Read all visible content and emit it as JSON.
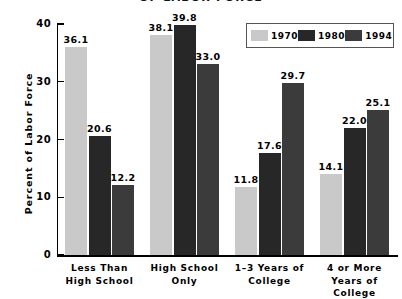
{
  "chart_data": {
    "type": "bar",
    "title": "OF LABOR FORCE",
    "xlabel": "",
    "ylabel": "Percent of Labor Force",
    "ylim": [
      0,
      40
    ],
    "yticks": [
      "0",
      "10",
      "20",
      "30",
      "40"
    ],
    "grid": false,
    "legend_position": "top-right",
    "categories": [
      "Less Than High School",
      "High School Only",
      "1–3 Years of College",
      "4 or More Years of College"
    ],
    "category_lines": [
      [
        "Less Than",
        "High School"
      ],
      [
        "High School",
        "Only"
      ],
      [
        "1–3 Years of",
        "College"
      ],
      [
        "4 or More",
        "Years of",
        "College"
      ]
    ],
    "series": [
      {
        "name": "1970",
        "color": "#c9c9c9",
        "values": [
          36.1,
          38.1,
          11.8,
          14.1
        ]
      },
      {
        "name": "1980",
        "color": "#272727",
        "values": [
          20.6,
          39.8,
          17.6,
          22.0
        ]
      },
      {
        "name": "1994",
        "color": "#3b3b3b",
        "values": [
          12.2,
          33.0,
          29.7,
          25.1
        ]
      }
    ],
    "value_labels": [
      [
        "36.1",
        "20.6",
        "12.2"
      ],
      [
        "38.1",
        "39.8",
        "33.0"
      ],
      [
        "11.8",
        "17.6",
        "29.7"
      ],
      [
        "14.1",
        "22.0",
        "25.1"
      ]
    ]
  },
  "legend": {
    "entries": [
      {
        "label": "1970"
      },
      {
        "label": "1980"
      },
      {
        "label": "1994"
      }
    ]
  }
}
